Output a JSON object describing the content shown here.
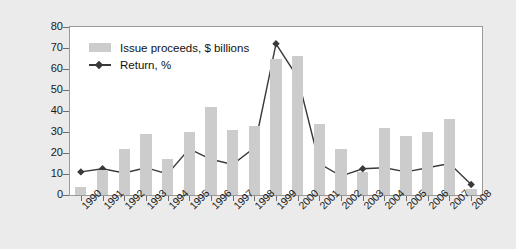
{
  "chart_data": {
    "type": "bar",
    "title": "",
    "subtitle": "",
    "xlabel": "",
    "ylabel": "",
    "ylim": [
      0,
      80
    ],
    "yticks": [
      0,
      10,
      20,
      30,
      40,
      50,
      60,
      70,
      80
    ],
    "grid": false,
    "legend_position": "top-left",
    "categories": [
      "1990",
      "1991",
      "1992",
      "1993",
      "1994",
      "1995",
      "1996",
      "1997",
      "1998",
      "1999",
      "2000",
      "2001",
      "2002",
      "2003",
      "2004",
      "2005",
      "2006",
      "2007",
      "2008"
    ],
    "series": [
      {
        "name": "Issue proceeds, $ billions",
        "type": "bar",
        "color": "#cccccc",
        "values": [
          4,
          12,
          22,
          29,
          17,
          30,
          42,
          31,
          33,
          65,
          66,
          34,
          22,
          11,
          32,
          28,
          30,
          36,
          3
        ]
      },
      {
        "name": "Return, %",
        "type": "line",
        "color": "#3a3a3a",
        "marker": "diamond",
        "values": [
          11,
          12.5,
          10.5,
          13,
          10,
          22,
          17,
          14.5,
          22.5,
          72,
          56,
          15,
          9,
          12.5,
          13,
          11,
          13,
          15,
          5
        ]
      }
    ]
  },
  "legend": {
    "items": [
      {
        "label": "Issue proceeds, $ billions",
        "marker": "bar-swatch"
      },
      {
        "label": "Return, %",
        "marker": "line-diamond"
      }
    ]
  },
  "axes": {
    "y_tick_labels": [
      "80",
      "70",
      "60",
      "50",
      "40",
      "30",
      "20",
      "10",
      "0"
    ],
    "x_tick_labels": [
      "1990",
      "1991",
      "1992",
      "1993",
      "1994",
      "1995",
      "1996",
      "1997",
      "1998",
      "1999",
      "2000",
      "2001",
      "2002",
      "2003",
      "2004",
      "2005",
      "2006",
      "2007",
      "2008"
    ]
  },
  "colors": {
    "background": "#ebebeb",
    "plot_background": "#ffffff",
    "bar": "#cccccc",
    "line": "#3a3a3a",
    "axis": "#6e6e6e",
    "text": "#1a1a1a"
  }
}
